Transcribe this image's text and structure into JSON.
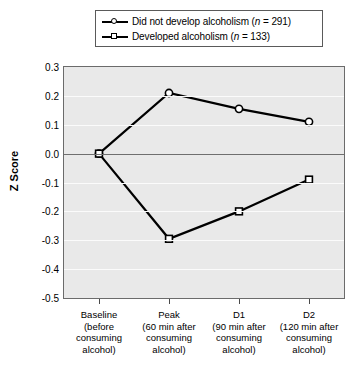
{
  "chart_data": {
    "type": "line",
    "title": "",
    "xlabel": "",
    "ylabel": "Z Score",
    "ylim": [
      -0.5,
      0.3
    ],
    "yticks": [
      "0.3",
      "0.2",
      "0.1",
      "0.0",
      "-0.1",
      "-0.2",
      "-0.3",
      "-0.4",
      "-0.5"
    ],
    "ytick_values": [
      0.3,
      0.2,
      0.1,
      0.0,
      -0.1,
      -0.2,
      -0.3,
      -0.4,
      -0.5
    ],
    "grid": true,
    "legend_position": "top",
    "categories": [
      "Baseline",
      "Peak",
      "D1",
      "D2"
    ],
    "category_sublabels": [
      [
        "(before",
        "consuming",
        "alcohol)"
      ],
      [
        "(60 min after",
        "consuming",
        "alcohol)"
      ],
      [
        "(90 min after",
        "consuming",
        "alcohol)"
      ],
      [
        "(120 min after",
        "consuming",
        "alcohol)"
      ]
    ],
    "series": [
      {
        "name": "Did not develop alcoholism",
        "n": 291,
        "marker": "open-circle",
        "values": [
          0.0,
          0.21,
          0.155,
          0.11
        ]
      },
      {
        "name": "Developed alcoholism",
        "n": 133,
        "marker": "open-square",
        "values": [
          0.0,
          -0.295,
          -0.2,
          -0.09
        ]
      }
    ]
  },
  "legend": {
    "items": [
      {
        "label": "Did not develop alcoholism",
        "n_prefix": "(",
        "n_italic": "n",
        "n_value": " = 291)",
        "marker": "open-circle"
      },
      {
        "label": "Developed alcoholism",
        "n_prefix": "(",
        "n_italic": "n",
        "n_value": " = 133)",
        "marker": "open-square"
      }
    ]
  },
  "axis": {
    "y_title": "Z Score"
  },
  "colors": {
    "plot_background": "#e9e9e9",
    "gridline": "#fbfbfb",
    "zeroline": "#6f6f6f",
    "series_line": "#000000",
    "marker_fill": "#ffffff",
    "axis_border": "#6b6b6b"
  }
}
